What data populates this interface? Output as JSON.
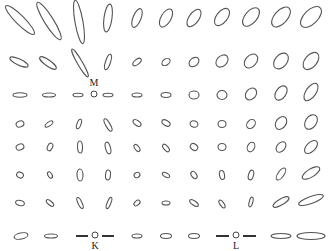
{
  "figure": {
    "width": 331,
    "height": 251,
    "stroke_color": "#555555",
    "grid": {
      "columns": [
        20,
        49,
        79,
        108,
        137,
        166,
        194,
        222,
        251,
        281,
        311
      ],
      "rows": [
        18,
        60,
        94,
        123,
        152,
        180,
        208,
        236
      ]
    },
    "labels": [
      {
        "id": "M",
        "text": "M",
        "x": 94,
        "y": 86
      },
      {
        "id": "K",
        "text": "K",
        "x": 95,
        "y": 249
      },
      {
        "id": "L",
        "text": "L",
        "x": 236,
        "y": 249
      }
    ],
    "points": [
      {
        "id": "M",
        "x": 94,
        "y": 94,
        "r": 3
      },
      {
        "id": "K",
        "x": 95,
        "y": 235,
        "r": 3
      },
      {
        "id": "L",
        "x": 236,
        "y": 235,
        "r": 3
      }
    ],
    "bars": [
      {
        "x1": 76,
        "y1": 236,
        "x2": 88,
        "y2": 236
      },
      {
        "x1": 102,
        "y1": 236,
        "x2": 114,
        "y2": 236
      },
      {
        "x1": 216,
        "y1": 236,
        "x2": 229,
        "y2": 236
      },
      {
        "x1": 243,
        "y1": 236,
        "x2": 256,
        "y2": 236
      }
    ],
    "ellipses": [
      {
        "cx": 20,
        "cy": 20,
        "rx": 20,
        "ry": 4.5,
        "rot": 45
      },
      {
        "cx": 49,
        "cy": 21,
        "rx": 22,
        "ry": 4.5,
        "rot": 58
      },
      {
        "cx": 79,
        "cy": 22,
        "rx": 22,
        "ry": 4,
        "rot": 80
      },
      {
        "cx": 108,
        "cy": 18,
        "rx": 14,
        "ry": 4,
        "rot": -82
      },
      {
        "cx": 137,
        "cy": 18,
        "rx": 10,
        "ry": 4,
        "rot": -68
      },
      {
        "cx": 166,
        "cy": 18,
        "rx": 10,
        "ry": 5,
        "rot": -60
      },
      {
        "cx": 194,
        "cy": 18,
        "rx": 10,
        "ry": 5,
        "rot": -55
      },
      {
        "cx": 222,
        "cy": 17,
        "rx": 10,
        "ry": 5.5,
        "rot": -52
      },
      {
        "cx": 251,
        "cy": 17,
        "rx": 11,
        "ry": 6,
        "rot": -50
      },
      {
        "cx": 281,
        "cy": 17,
        "rx": 12,
        "ry": 6.5,
        "rot": -48
      },
      {
        "cx": 311,
        "cy": 17,
        "rx": 13,
        "ry": 7,
        "rot": -45
      },
      {
        "cx": 19,
        "cy": 62,
        "rx": 10,
        "ry": 3,
        "rot": 25
      },
      {
        "cx": 48,
        "cy": 63,
        "rx": 10,
        "ry": 3,
        "rot": 35
      },
      {
        "cx": 80,
        "cy": 63,
        "rx": 16,
        "ry": 2.5,
        "rot": 60
      },
      {
        "cx": 108,
        "cy": 62,
        "rx": 8,
        "ry": 2.5,
        "rot": -72
      },
      {
        "cx": 137,
        "cy": 62,
        "rx": 5,
        "ry": 2.5,
        "rot": -40
      },
      {
        "cx": 166,
        "cy": 62,
        "rx": 4.5,
        "ry": 3,
        "rot": -35
      },
      {
        "cx": 194,
        "cy": 62,
        "rx": 5.5,
        "ry": 4,
        "rot": -40
      },
      {
        "cx": 222,
        "cy": 61,
        "rx": 7,
        "ry": 5,
        "rot": -45
      },
      {
        "cx": 251,
        "cy": 61,
        "rx": 8,
        "ry": 5.5,
        "rot": -48
      },
      {
        "cx": 281,
        "cy": 61,
        "rx": 9,
        "ry": 6,
        "rot": -50
      },
      {
        "cx": 311,
        "cy": 61,
        "rx": 10,
        "ry": 6,
        "rot": -50
      },
      {
        "cx": 20,
        "cy": 95,
        "rx": 7,
        "ry": 2.2,
        "rot": 0
      },
      {
        "cx": 49,
        "cy": 95,
        "rx": 6.5,
        "ry": 2,
        "rot": 0
      },
      {
        "cx": 78,
        "cy": 95,
        "rx": 5,
        "ry": 1.8,
        "rot": 0
      },
      {
        "cx": 108,
        "cy": 95,
        "rx": 5,
        "ry": 1.8,
        "rot": 0
      },
      {
        "cx": 137,
        "cy": 95,
        "rx": 5,
        "ry": 2,
        "rot": 0
      },
      {
        "cx": 166,
        "cy": 95,
        "rx": 5,
        "ry": 2.5,
        "rot": 0
      },
      {
        "cx": 194,
        "cy": 95,
        "rx": 5,
        "ry": 4,
        "rot": 0
      },
      {
        "cx": 222,
        "cy": 95,
        "rx": 5,
        "ry": 4.5,
        "rot": 0
      },
      {
        "cx": 251,
        "cy": 94,
        "rx": 6.5,
        "ry": 5,
        "rot": -50
      },
      {
        "cx": 281,
        "cy": 93,
        "rx": 8,
        "ry": 5,
        "rot": -55
      },
      {
        "cx": 311,
        "cy": 92,
        "rx": 10,
        "ry": 5,
        "rot": -55
      },
      {
        "cx": 20,
        "cy": 124,
        "rx": 4,
        "ry": 3,
        "rot": -20
      },
      {
        "cx": 49,
        "cy": 124,
        "rx": 4.5,
        "ry": 2,
        "rot": -35
      },
      {
        "cx": 79,
        "cy": 124,
        "rx": 5,
        "ry": 2,
        "rot": -70
      },
      {
        "cx": 108,
        "cy": 125,
        "rx": 7,
        "ry": 2.2,
        "rot": 60
      },
      {
        "cx": 137,
        "cy": 123,
        "rx": 4.5,
        "ry": 2.5,
        "rot": 35
      },
      {
        "cx": 166,
        "cy": 123,
        "rx": 4.5,
        "ry": 2.5,
        "rot": 30
      },
      {
        "cx": 194,
        "cy": 124,
        "rx": 4,
        "ry": 3.2,
        "rot": 20
      },
      {
        "cx": 222,
        "cy": 124,
        "rx": 4,
        "ry": 3.5,
        "rot": 0
      },
      {
        "cx": 251,
        "cy": 124,
        "rx": 5,
        "ry": 3.8,
        "rot": -50
      },
      {
        "cx": 281,
        "cy": 123,
        "rx": 7,
        "ry": 5,
        "rot": -55
      },
      {
        "cx": 311,
        "cy": 122,
        "rx": 8,
        "ry": 5.5,
        "rot": -55
      },
      {
        "cx": 20,
        "cy": 147,
        "rx": 4,
        "ry": 3,
        "rot": -20
      },
      {
        "cx": 50,
        "cy": 147,
        "rx": 4,
        "ry": 2.5,
        "rot": -65
      },
      {
        "cx": 80,
        "cy": 147,
        "rx": 6,
        "ry": 2.5,
        "rot": 88
      },
      {
        "cx": 108,
        "cy": 148,
        "rx": 6,
        "ry": 2.5,
        "rot": 75
      },
      {
        "cx": 137,
        "cy": 148,
        "rx": 4,
        "ry": 2.2,
        "rot": 55
      },
      {
        "cx": 166,
        "cy": 148,
        "rx": 4.5,
        "ry": 2.2,
        "rot": 50
      },
      {
        "cx": 194,
        "cy": 147,
        "rx": 4,
        "ry": 3,
        "rot": 35
      },
      {
        "cx": 222,
        "cy": 147,
        "rx": 4,
        "ry": 3.5,
        "rot": 0
      },
      {
        "cx": 251,
        "cy": 147,
        "rx": 5,
        "ry": 3.5,
        "rot": -65
      },
      {
        "cx": 281,
        "cy": 147,
        "rx": 6,
        "ry": 4,
        "rot": -50
      },
      {
        "cx": 311,
        "cy": 147,
        "rx": 8,
        "ry": 4.5,
        "rot": -45
      },
      {
        "cx": 20,
        "cy": 175,
        "rx": 3.5,
        "ry": 2.8,
        "rot": 30
      },
      {
        "cx": 50,
        "cy": 175,
        "rx": 3.5,
        "ry": 2,
        "rot": 60
      },
      {
        "cx": 80,
        "cy": 175,
        "rx": 6,
        "ry": 3,
        "rot": 88
      },
      {
        "cx": 108,
        "cy": 175,
        "rx": 5,
        "ry": 2.5,
        "rot": -85
      },
      {
        "cx": 137,
        "cy": 175,
        "rx": 3,
        "ry": 2.5,
        "rot": -30
      },
      {
        "cx": 166,
        "cy": 175,
        "rx": 4,
        "ry": 2,
        "rot": 30
      },
      {
        "cx": 194,
        "cy": 175,
        "rx": 4,
        "ry": 2.5,
        "rot": 55
      },
      {
        "cx": 222,
        "cy": 175,
        "rx": 4.5,
        "ry": 2.5,
        "rot": 80
      },
      {
        "cx": 251,
        "cy": 175,
        "rx": 5,
        "ry": 2.5,
        "rot": -75
      },
      {
        "cx": 281,
        "cy": 174,
        "rx": 7,
        "ry": 3,
        "rot": -55
      },
      {
        "cx": 311,
        "cy": 173,
        "rx": 10,
        "ry": 4,
        "rot": -32
      },
      {
        "cx": 20,
        "cy": 203,
        "rx": 4.5,
        "ry": 2.5,
        "rot": 15
      },
      {
        "cx": 50,
        "cy": 203,
        "rx": 4.5,
        "ry": 2,
        "rot": 40
      },
      {
        "cx": 80,
        "cy": 203,
        "rx": 6,
        "ry": 2,
        "rot": 65
      },
      {
        "cx": 109,
        "cy": 203,
        "rx": 6,
        "ry": 1.8,
        "rot": -68
      },
      {
        "cx": 137,
        "cy": 203,
        "rx": 3.5,
        "ry": 2.2,
        "rot": -40
      },
      {
        "cx": 166,
        "cy": 203,
        "rx": 4,
        "ry": 2,
        "rot": 0
      },
      {
        "cx": 194,
        "cy": 203,
        "rx": 5,
        "ry": 2.2,
        "rot": 35
      },
      {
        "cx": 222,
        "cy": 204,
        "rx": 4.5,
        "ry": 2,
        "rot": 55
      },
      {
        "cx": 251,
        "cy": 202,
        "rx": 5,
        "ry": 1.8,
        "rot": -75
      },
      {
        "cx": 281,
        "cy": 202,
        "rx": 9,
        "ry": 3,
        "rot": -30
      },
      {
        "cx": 311,
        "cy": 200,
        "rx": 13,
        "ry": 3.5,
        "rot": -20
      },
      {
        "cx": 21,
        "cy": 236,
        "rx": 7,
        "ry": 3,
        "rot": -12
      },
      {
        "cx": 51,
        "cy": 236,
        "rx": 6.5,
        "ry": 2,
        "rot": 0
      },
      {
        "cx": 137,
        "cy": 236,
        "rx": 5,
        "ry": 2,
        "rot": 0
      },
      {
        "cx": 166,
        "cy": 236,
        "rx": 5.5,
        "ry": 2.5,
        "rot": 0
      },
      {
        "cx": 194,
        "cy": 236,
        "rx": 5.5,
        "ry": 2.5,
        "rot": 0
      },
      {
        "cx": 281,
        "cy": 236,
        "rx": 10,
        "ry": 2.5,
        "rot": 0
      },
      {
        "cx": 311,
        "cy": 236,
        "rx": 14,
        "ry": 3.5,
        "rot": 0
      }
    ]
  }
}
